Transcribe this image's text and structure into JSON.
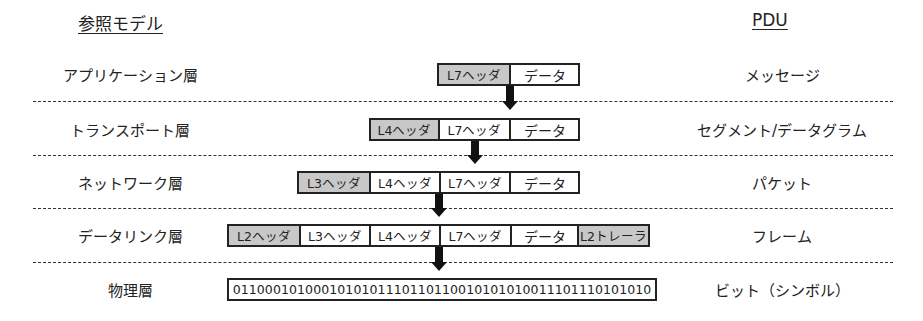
{
  "headers": {
    "left": "参照モデル",
    "right": "PDU"
  },
  "layers": [
    {
      "name": "アプリケーション層",
      "pdu": "メッセージ",
      "cells": [
        {
          "label": "L7ヘッダ",
          "gray": true
        },
        {
          "label": "データ",
          "gray": false
        }
      ]
    },
    {
      "name": "トランスポート層",
      "pdu": "セグメント/データグラム",
      "cells": [
        {
          "label": "L4ヘッダ",
          "gray": true
        },
        {
          "label": "L7ヘッダ",
          "gray": false
        },
        {
          "label": "データ",
          "gray": false
        }
      ]
    },
    {
      "name": "ネットワーク層",
      "pdu": "パケット",
      "cells": [
        {
          "label": "L3ヘッダ",
          "gray": true
        },
        {
          "label": "L4ヘッダ",
          "gray": false
        },
        {
          "label": "L7ヘッダ",
          "gray": false
        },
        {
          "label": "データ",
          "gray": false
        }
      ]
    },
    {
      "name": "データリンク層",
      "pdu": "フレーム",
      "cells": [
        {
          "label": "L2ヘッダ",
          "gray": true
        },
        {
          "label": "L3ヘッダ",
          "gray": false
        },
        {
          "label": "L4ヘッダ",
          "gray": false
        },
        {
          "label": "L7ヘッダ",
          "gray": false
        },
        {
          "label": "データ",
          "gray": false
        },
        {
          "label": "L2トレーラ",
          "gray": true
        }
      ]
    },
    {
      "name": "物理層",
      "pdu": "ビット（シンボル）",
      "cells": [
        {
          "label": "0110001010001010101110110110010101010011101110101010",
          "gray": false
        }
      ]
    }
  ],
  "colors": {
    "header_fill": "#c8c8c8",
    "border": "#222222"
  }
}
